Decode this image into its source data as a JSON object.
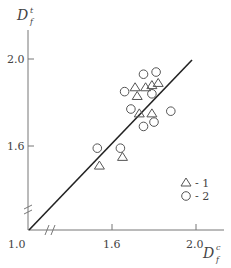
{
  "chart_data": {
    "type": "scatter",
    "title": "",
    "xlabel": "D_f^c",
    "ylabel": "D_f^t",
    "xlim": [
      1.0,
      2.1
    ],
    "ylim": [
      1.0,
      2.2
    ],
    "x_ticks": [
      "1.0",
      "1.6",
      "2.0"
    ],
    "y_ticks": [
      "1.6",
      "2.0"
    ],
    "axis_breaks": true,
    "grid": false,
    "legend_position": "lower right",
    "reference_line": {
      "x": [
        1.0,
        2.0
      ],
      "y": [
        1.0,
        2.0
      ],
      "label": "y = x"
    },
    "series": [
      {
        "name": "1",
        "marker": "triangle",
        "x": [
          1.54,
          1.65,
          1.71,
          1.72,
          1.73,
          1.76,
          1.79,
          1.79,
          1.82
        ],
        "y": [
          1.51,
          1.55,
          1.87,
          1.83,
          1.75,
          1.87,
          1.75,
          1.88,
          1.89
        ]
      },
      {
        "name": "2",
        "marker": "circle",
        "x": [
          1.53,
          1.64,
          1.66,
          1.69,
          1.75,
          1.75,
          1.79,
          1.8,
          1.81,
          1.88
        ],
        "y": [
          1.59,
          1.59,
          1.85,
          1.77,
          1.93,
          1.69,
          1.84,
          1.71,
          1.94,
          1.76
        ]
      }
    ]
  },
  "labels": {
    "y_axis_title_main": "D",
    "y_axis_title_sub": "f",
    "y_axis_title_sup": "t",
    "x_axis_title_main": "D",
    "x_axis_title_sub": "f",
    "x_axis_title_sup": "c",
    "x_tick_1": "1.0",
    "x_tick_2": "1.6",
    "x_tick_3": "2.0",
    "y_tick_1": "1.6",
    "y_tick_2": "2.0",
    "legend_1": "- 1",
    "legend_2": "- 2"
  }
}
